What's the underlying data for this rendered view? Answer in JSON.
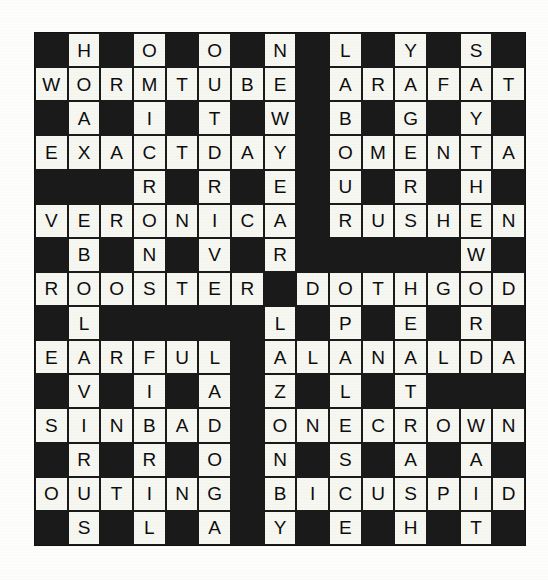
{
  "puzzle": {
    "type": "crossword",
    "rows": 15,
    "columns": 15,
    "colors": {
      "block": "#1a1a1a",
      "cell_fill": "#f7f7f2",
      "letter": "#0d0d0d",
      "page_background": "#fdfdfb"
    },
    "grid": [
      [
        "",
        "H",
        "",
        "O",
        "",
        "O",
        "",
        "N",
        "",
        "L",
        "",
        "Y",
        "",
        "S",
        ""
      ],
      [
        "W",
        "O",
        "R",
        "M",
        "T",
        "U",
        "B",
        "E",
        "",
        "A",
        "R",
        "A",
        "F",
        "A",
        "T"
      ],
      [
        "",
        "A",
        "",
        "I",
        "",
        "T",
        "",
        "W",
        "",
        "B",
        "",
        "G",
        "",
        "Y",
        ""
      ],
      [
        "E",
        "X",
        "A",
        "C",
        "T",
        "D",
        "A",
        "Y",
        "",
        "O",
        "M",
        "E",
        "N",
        "T",
        "A"
      ],
      [
        "",
        "",
        "",
        "R",
        "",
        "R",
        "",
        "E",
        "",
        "U",
        "",
        "R",
        "",
        "H",
        ""
      ],
      [
        "V",
        "E",
        "R",
        "O",
        "N",
        "I",
        "C",
        "A",
        "",
        "R",
        "U",
        "S",
        "H",
        "E",
        "N"
      ],
      [
        "",
        "B",
        "",
        "N",
        "",
        "V",
        "",
        "R",
        "",
        "",
        "",
        "",
        "",
        "W",
        ""
      ],
      [
        "R",
        "O",
        "O",
        "S",
        "T",
        "E",
        "R",
        "",
        "D",
        "O",
        "T",
        "H",
        "G",
        "O",
        "D"
      ],
      [
        "",
        "L",
        "",
        "",
        "",
        "",
        "",
        "L",
        "",
        "P",
        "",
        "E",
        "",
        "R",
        ""
      ],
      [
        "E",
        "A",
        "R",
        "F",
        "U",
        "L",
        "",
        "A",
        "L",
        "A",
        "N",
        "A",
        "L",
        "D",
        "A"
      ],
      [
        "",
        "V",
        "",
        "I",
        "",
        "A",
        "",
        "Z",
        "",
        "L",
        "",
        "T",
        "",
        "",
        ""
      ],
      [
        "S",
        "I",
        "N",
        "B",
        "A",
        "D",
        "",
        "O",
        "N",
        "E",
        "C",
        "R",
        "O",
        "W",
        "N"
      ],
      [
        "",
        "R",
        "",
        "R",
        "",
        "O",
        "",
        "N",
        "",
        "S",
        "",
        "A",
        "",
        "A",
        ""
      ],
      [
        "O",
        "U",
        "T",
        "I",
        "N",
        "G",
        "",
        "B",
        "I",
        "C",
        "U",
        "S",
        "P",
        "I",
        "D"
      ],
      [
        "",
        "S",
        "",
        "L",
        "",
        "A",
        "",
        "Y",
        "",
        "E",
        "",
        "H",
        "",
        "T",
        ""
      ]
    ],
    "across_answers": [
      "WORMTUBE",
      "ARAFAT",
      "EXACTDAY",
      "OMENTA",
      "VERONICA",
      "RUSHEN",
      "ROOSTER",
      "DOTHGOD",
      "EARFUL",
      "ALANALDA",
      "SINBAD",
      "ONECROWN",
      "OUTING",
      "BICUSPID"
    ],
    "down_answers": [
      "HOAXABLE",
      "OMICRONS",
      "OUTDIVER",
      "NEWYEARS",
      "LABOURS",
      "YGREST",
      "SAYTHAW",
      "HIGHLANDS",
      "PLEASE",
      "ERATRASH",
      "RDAWAIT"
    ]
  }
}
